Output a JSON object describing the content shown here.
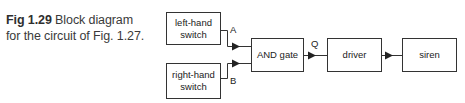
{
  "caption": {
    "figure_number": "Fig 1.29",
    "text_line1": " Block diagram",
    "text_line2": "for the circuit of Fig. 1.27."
  },
  "blocks": {
    "left_switch": {
      "line1": "left-hand",
      "line2": "switch"
    },
    "right_switch": {
      "line1": "right-hand",
      "line2": "switch"
    },
    "and_gate": {
      "label": "AND gate"
    },
    "driver": {
      "label": "driver"
    },
    "siren": {
      "label": "siren"
    }
  },
  "signals": {
    "a": "A",
    "b": "B",
    "q": "Q"
  },
  "connections": [
    {
      "from": "left-hand switch",
      "to": "AND gate",
      "signal": "A"
    },
    {
      "from": "right-hand switch",
      "to": "AND gate",
      "signal": "B"
    },
    {
      "from": "AND gate",
      "to": "driver",
      "signal": "Q"
    },
    {
      "from": "driver",
      "to": "siren",
      "signal": ""
    }
  ],
  "colors": {
    "line": "#333333",
    "text": "#222222",
    "caption": "#3a3a3a"
  }
}
